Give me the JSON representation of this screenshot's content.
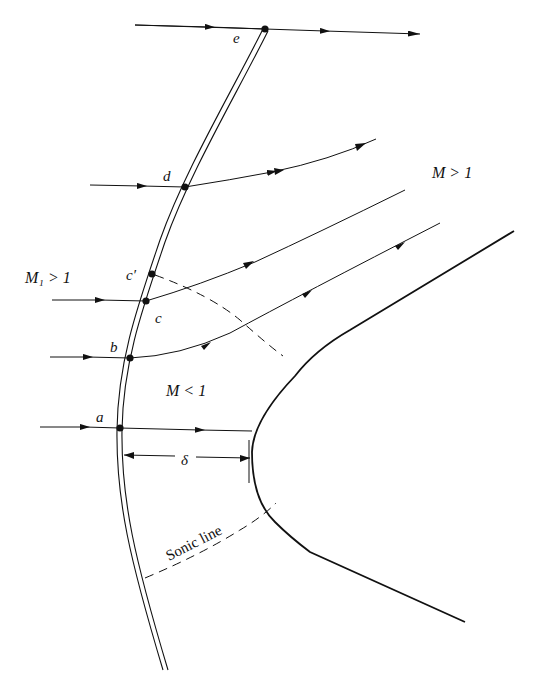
{
  "diagram": {
    "type": "detached bow shock in front of blunt body",
    "colors": {
      "ink": "#111111",
      "background": "#ffffff"
    },
    "regions": {
      "freestream": "M₁ > 1",
      "downstream_supersonic": "M > 1",
      "subsonic": "M < 1"
    },
    "points": {
      "a": "a",
      "b": "b",
      "c": "c",
      "c_prime": "c′",
      "d": "d",
      "e": "e"
    },
    "annotations": {
      "standoff_distance": "δ",
      "sonic_line": "Sonic line"
    },
    "elements": [
      "bow-shock (double line)",
      "blunt-body",
      "streamlines through a, b, c, d, e",
      "sonic lines (dashed)",
      "standoff dimension"
    ]
  }
}
